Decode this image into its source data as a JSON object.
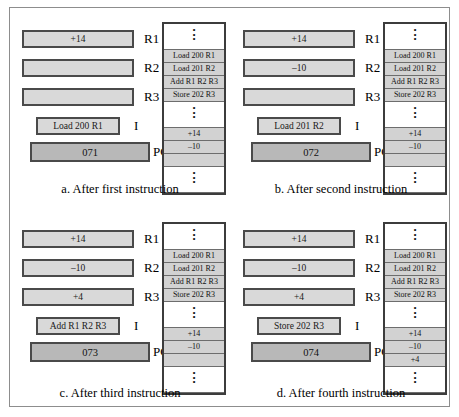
{
  "figure": {
    "colors": {
      "register_fill": "#d9d9d9",
      "pc_fill": "#b8b8b8",
      "memory_fill": "#d2d2d2",
      "border": "#4a4a4a",
      "frame": "#8d8d8d"
    },
    "memory_addresses": [
      "070",
      "071",
      "072",
      "073",
      "200",
      "201",
      "202"
    ],
    "program": [
      "Load 200 R1",
      "Load 201 R2",
      "Add R1 R2 R3",
      "Store 202 R3"
    ],
    "ellipsis_glyph": "•"
  },
  "panels": [
    {
      "id": "a",
      "caption": "a. After first instruction",
      "registers": [
        {
          "label": "R1",
          "value": "+14"
        },
        {
          "label": "R2",
          "value": ""
        },
        {
          "label": "R3",
          "value": ""
        }
      ],
      "instruction_register": {
        "label": "I",
        "value": "Load 200 R1"
      },
      "program_counter": {
        "label": "PC",
        "value": "071"
      },
      "memory": [
        {
          "addr": "070",
          "value": "Load 200 R1",
          "filled": true
        },
        {
          "addr": "071",
          "value": "Load 201 R2",
          "filled": true
        },
        {
          "addr": "072",
          "value": "Add R1 R2 R3",
          "filled": true
        },
        {
          "addr": "073",
          "value": "Store 202 R3",
          "filled": true
        },
        {
          "addr": "200",
          "value": "+14",
          "filled": true
        },
        {
          "addr": "201",
          "value": "–10",
          "filled": true
        },
        {
          "addr": "202",
          "value": "",
          "filled": true
        }
      ]
    },
    {
      "id": "b",
      "caption": "b. After second instruction",
      "registers": [
        {
          "label": "R1",
          "value": "+14"
        },
        {
          "label": "R2",
          "value": "–10"
        },
        {
          "label": "R3",
          "value": ""
        }
      ],
      "instruction_register": {
        "label": "I",
        "value": "Load 201 R2"
      },
      "program_counter": {
        "label": "PC",
        "value": "072"
      },
      "memory": [
        {
          "addr": "070",
          "value": "Load 200 R1",
          "filled": true
        },
        {
          "addr": "071",
          "value": "Load 201 R2",
          "filled": true
        },
        {
          "addr": "072",
          "value": "Add R1 R2 R3",
          "filled": true
        },
        {
          "addr": "073",
          "value": "Store 202 R3",
          "filled": true
        },
        {
          "addr": "200",
          "value": "+14",
          "filled": true
        },
        {
          "addr": "201",
          "value": "–10",
          "filled": true
        },
        {
          "addr": "202",
          "value": "",
          "filled": true
        }
      ]
    },
    {
      "id": "c",
      "caption": "c. After third instruction",
      "registers": [
        {
          "label": "R1",
          "value": "+14"
        },
        {
          "label": "R2",
          "value": "–10"
        },
        {
          "label": "R3",
          "value": "+4"
        }
      ],
      "instruction_register": {
        "label": "I",
        "value": "Add R1 R2 R3"
      },
      "program_counter": {
        "label": "PC",
        "value": "073"
      },
      "memory": [
        {
          "addr": "070",
          "value": "Load 200 R1",
          "filled": true
        },
        {
          "addr": "071",
          "value": "Load 201 R2",
          "filled": true
        },
        {
          "addr": "072",
          "value": "Add R1 R2 R3",
          "filled": true
        },
        {
          "addr": "073",
          "value": "Store 202 R3",
          "filled": true
        },
        {
          "addr": "200",
          "value": "+14",
          "filled": true
        },
        {
          "addr": "201",
          "value": "–10",
          "filled": true
        },
        {
          "addr": "202",
          "value": "",
          "filled": true
        }
      ]
    },
    {
      "id": "d",
      "caption": "d. After fourth instruction",
      "registers": [
        {
          "label": "R1",
          "value": "+14"
        },
        {
          "label": "R2",
          "value": "–10"
        },
        {
          "label": "R3",
          "value": "+4"
        }
      ],
      "instruction_register": {
        "label": "I",
        "value": "Store 202 R3"
      },
      "program_counter": {
        "label": "PC",
        "value": "074"
      },
      "memory": [
        {
          "addr": "070",
          "value": "Load 200 R1",
          "filled": true
        },
        {
          "addr": "071",
          "value": "Load 201 R2",
          "filled": true
        },
        {
          "addr": "072",
          "value": "Add R1 R2 R3",
          "filled": true
        },
        {
          "addr": "073",
          "value": "Store 202 R3",
          "filled": true
        },
        {
          "addr": "200",
          "value": "+14",
          "filled": true
        },
        {
          "addr": "201",
          "value": "–10",
          "filled": true
        },
        {
          "addr": "202",
          "value": "+4",
          "filled": true
        }
      ]
    }
  ]
}
